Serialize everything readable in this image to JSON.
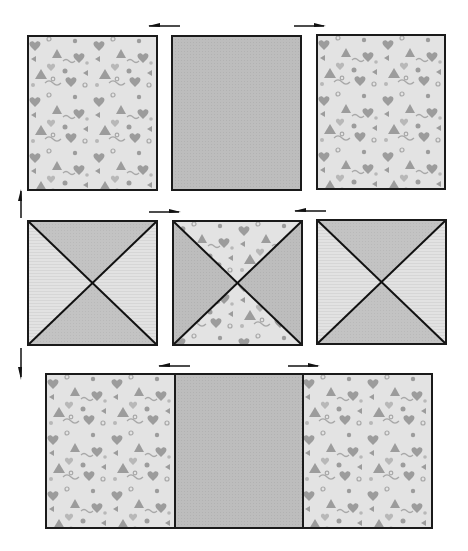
{
  "diagram": {
    "title": "",
    "colors": {
      "outline": "#1a1a1a",
      "solid_fabric": "#bdbdbd",
      "print_background": "#e3e3e3",
      "print_motif": "#9c9c9c",
      "print_motif_light": "#b8b8b8",
      "triangle_dark": "#c3c3c3",
      "triangle_light": "#e2e2e2",
      "triangle_center_dark": "#b5b5b5",
      "arrow": "#111111"
    },
    "rows": [
      {
        "name": "top-row",
        "units": [
          {
            "name": "print-rectangle-left",
            "fabric": "print"
          },
          {
            "name": "solid-rectangle-center",
            "fabric": "solid"
          },
          {
            "name": "print-rectangle-right",
            "fabric": "print"
          }
        ],
        "arrows": [
          {
            "name": "press-arrow-left",
            "direction": "left"
          },
          {
            "name": "press-arrow-right",
            "direction": "right"
          }
        ]
      },
      {
        "name": "middle-row",
        "units": [
          {
            "name": "hourglass-block-left",
            "fabric": "solid-light-hourglass"
          },
          {
            "name": "hourglass-block-center",
            "fabric": "print-solid-hourglass"
          },
          {
            "name": "hourglass-block-right",
            "fabric": "solid-light-hourglass"
          }
        ],
        "arrows": [
          {
            "name": "press-arrow-right",
            "direction": "right"
          },
          {
            "name": "press-arrow-left",
            "direction": "left"
          }
        ]
      },
      {
        "name": "bottom-row",
        "units": [
          {
            "name": "print-square-left",
            "fabric": "print"
          },
          {
            "name": "solid-square-center",
            "fabric": "solid"
          },
          {
            "name": "print-square-right",
            "fabric": "print"
          }
        ],
        "arrows": [
          {
            "name": "press-arrow-left",
            "direction": "left"
          },
          {
            "name": "press-arrow-right",
            "direction": "right"
          }
        ]
      }
    ],
    "row_arrows": [
      {
        "name": "row-press-arrow-up",
        "direction": "up"
      },
      {
        "name": "row-press-arrow-down",
        "direction": "down"
      }
    ]
  }
}
